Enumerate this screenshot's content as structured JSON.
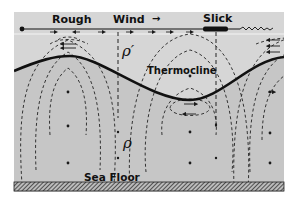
{
  "figure": {
    "type": "schematic diagram",
    "colors": {
      "background": "#ffffff",
      "water_upper": "#d9d9d9",
      "water_lower": "#c4c4c4",
      "lines": "#1a1a1a"
    }
  },
  "labels": {
    "rough": "Rough",
    "wind": "Wind",
    "wind_arrow": "→",
    "slick": "Slick",
    "thermocline": "Thermocline",
    "rho_upper": "ρ′",
    "rho_lower": "ρ",
    "sea_floor": "Sea Floor"
  },
  "layers": [
    {
      "name": "upper layer",
      "density_symbol": "ρ′"
    },
    {
      "name": "lower layer",
      "density_symbol": "ρ"
    }
  ],
  "surface_features": [
    {
      "label": "Rough",
      "position": "above thermocline crest (left)"
    },
    {
      "label": "Slick",
      "position": "above descending thermocline (right)"
    }
  ]
}
